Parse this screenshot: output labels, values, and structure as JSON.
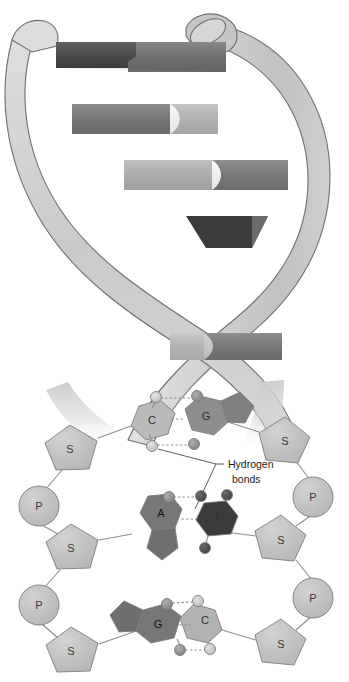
{
  "figure": {
    "type": "biology-diagram"
  },
  "palette": {
    "background": "#ffffff",
    "ribbon_light": "#d2d2d2",
    "ribbon_shade": "#bdbdbd",
    "rung_dark": "#3d3d3d",
    "rung_mid": "#787878",
    "rung_light": "#b5b5b5",
    "base_light": "#b9b9b9",
    "base_mid": "#909090",
    "base_dark": "#6f6f6f",
    "base_darkest": "#3a3a3a",
    "sugar_fill": "#bfbfbf",
    "phosphate_fill": "#c6c6c6",
    "dot_light": "#c9c9c9",
    "dot_mid": "#909090",
    "dot_dark": "#4a4a4a",
    "outline": "#7d7d7d",
    "text": "#2b2b2b"
  },
  "helix": {
    "name": "dna-double-helix",
    "strand_count": 2,
    "rungs": [
      {
        "index": 1,
        "y": 56,
        "tone": "dark"
      },
      {
        "index": 2,
        "y": 118,
        "tone": "mid"
      },
      {
        "index": 3,
        "y": 172,
        "tone": "mid"
      },
      {
        "index": 4,
        "y": 228,
        "tone": "dark"
      },
      {
        "index": 5,
        "y": 340,
        "tone": "mid"
      }
    ]
  },
  "annotations": {
    "hydrogen_bonds": {
      "line1": "Hydrogen",
      "line2": "bonds"
    }
  },
  "detail": {
    "name": "base-pair-detail",
    "left_backbone": [
      {
        "kind": "sugar",
        "label": "S",
        "x": 72,
        "y": 449
      },
      {
        "kind": "phosphate",
        "label": "P",
        "x": 39,
        "y": 506
      },
      {
        "kind": "sugar",
        "label": "S",
        "x": 72,
        "y": 548
      },
      {
        "kind": "phosphate",
        "label": "P",
        "x": 39,
        "y": 605
      },
      {
        "kind": "sugar",
        "label": "S",
        "x": 72,
        "y": 651
      }
    ],
    "right_backbone": [
      {
        "kind": "sugar",
        "label": "S",
        "x": 286,
        "y": 441
      },
      {
        "kind": "phosphate",
        "label": "P",
        "x": 313,
        "y": 497
      },
      {
        "kind": "sugar",
        "label": "S",
        "x": 282,
        "y": 540
      },
      {
        "kind": "phosphate",
        "label": "P",
        "x": 313,
        "y": 598
      },
      {
        "kind": "sugar",
        "label": "S",
        "x": 282,
        "y": 644
      }
    ],
    "base_pairs": [
      {
        "index": 1,
        "left_base": {
          "letter": "C",
          "type": "pyrimidine",
          "tone": "light"
        },
        "right_base": {
          "letter": "G",
          "type": "purine",
          "tone": "dark"
        },
        "hydrogen_bonds": 3,
        "y": 422
      },
      {
        "index": 2,
        "left_base": {
          "letter": "A",
          "type": "purine",
          "tone": "mid"
        },
        "right_base": {
          "letter": "T",
          "type": "pyrimidine",
          "tone": "darkest"
        },
        "hydrogen_bonds": 2,
        "y": 527
      },
      {
        "index": 3,
        "left_base": {
          "letter": "G",
          "type": "purine",
          "tone": "dark"
        },
        "right_base": {
          "letter": "C",
          "type": "pyrimidine",
          "tone": "light"
        },
        "hydrogen_bonds": 3,
        "y": 625
      }
    ]
  }
}
